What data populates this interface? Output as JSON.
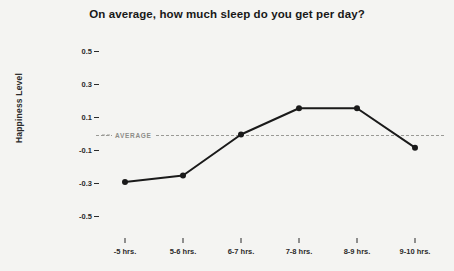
{
  "chart_data": {
    "type": "line",
    "title": "On average, how much sleep do you get per day?",
    "xlabel": "",
    "ylabel": "Happiness Level",
    "categories": [
      "-5 hrs.",
      "5-6 hrs.",
      "6-7 hrs.",
      "7-8 hrs.",
      "8-9 hrs.",
      "9-10 hrs."
    ],
    "values": [
      -0.29,
      -0.25,
      0.0,
      0.16,
      0.16,
      -0.08
    ],
    "ylim": [
      -0.6,
      0.6
    ],
    "yticks": [
      0.5,
      0.3,
      0.1,
      -0.1,
      -0.3,
      -0.5
    ],
    "ytick_labels": [
      "0.5",
      "0.3",
      "0.1",
      "-0.1",
      "-0.3",
      "-0.5"
    ],
    "grid": false,
    "legend": null,
    "annotations": [
      {
        "name": "average-reference-line",
        "label": "AVERAGE",
        "value": 0.0,
        "style": "dashed"
      }
    ],
    "colors": {
      "background": "#f4f4f2",
      "line": "#1a1a1a",
      "marker": "#1a1a1a",
      "average": "#9a9a96",
      "text": "#2b2b2b"
    }
  }
}
